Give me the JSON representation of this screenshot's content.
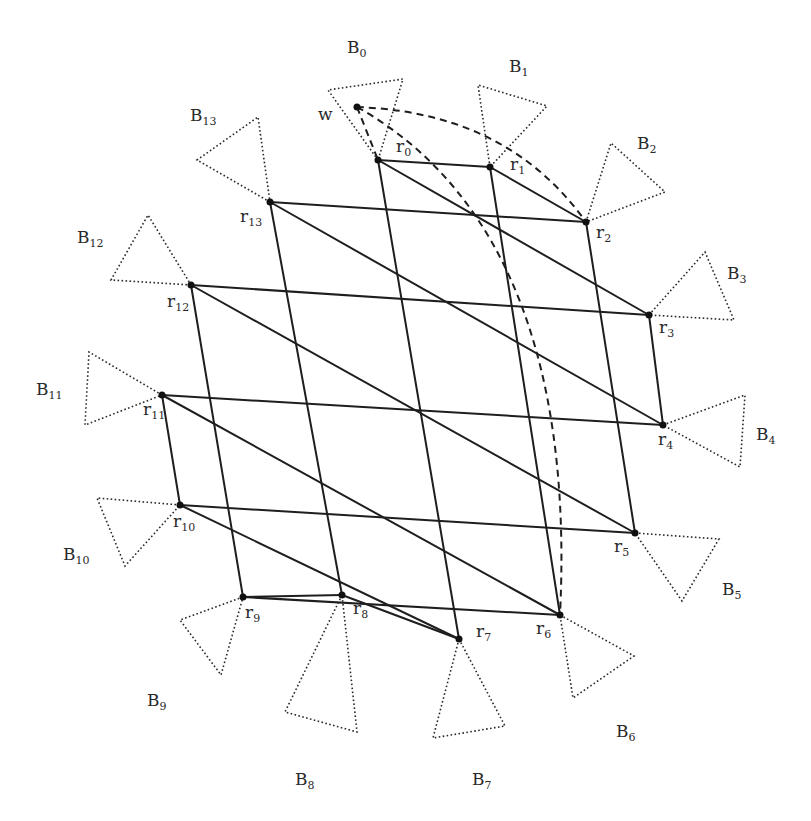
{
  "diagram": {
    "colors": {
      "ink": "#1e1e1e",
      "background": "#ffffff"
    },
    "w": {
      "label": "w",
      "x": 357,
      "y": 107,
      "label_x": 318,
      "label_y": 120
    },
    "nodes": [
      {
        "id": "r0",
        "base": "r",
        "sub": "0",
        "x": 378,
        "y": 160,
        "lx": 396,
        "ly": 152
      },
      {
        "id": "r1",
        "base": "r",
        "sub": "1",
        "x": 490,
        "y": 167,
        "lx": 510,
        "ly": 170
      },
      {
        "id": "r2",
        "base": "r",
        "sub": "2",
        "x": 586,
        "y": 222,
        "lx": 596,
        "ly": 238
      },
      {
        "id": "r3",
        "base": "r",
        "sub": "3",
        "x": 649,
        "y": 315,
        "lx": 659,
        "ly": 333
      },
      {
        "id": "r4",
        "base": "r",
        "sub": "4",
        "x": 663,
        "y": 425,
        "lx": 658,
        "ly": 445
      },
      {
        "id": "r5",
        "base": "r",
        "sub": "5",
        "x": 635,
        "y": 533,
        "lx": 614,
        "ly": 552
      },
      {
        "id": "r6",
        "base": "r",
        "sub": "6",
        "x": 560,
        "y": 615,
        "lx": 536,
        "ly": 634
      },
      {
        "id": "r7",
        "base": "r",
        "sub": "7",
        "x": 459,
        "y": 639,
        "lx": 476,
        "ly": 637
      },
      {
        "id": "r8",
        "base": "r",
        "sub": "8",
        "x": 342,
        "y": 595,
        "lx": 353,
        "ly": 614
      },
      {
        "id": "r9",
        "base": "r",
        "sub": "9",
        "x": 243,
        "y": 597,
        "lx": 245,
        "ly": 618
      },
      {
        "id": "r10",
        "base": "r",
        "sub": "10",
        "x": 180,
        "y": 505,
        "lx": 173,
        "ly": 527
      },
      {
        "id": "r11",
        "base": "r",
        "sub": "11",
        "x": 162,
        "y": 395,
        "lx": 143,
        "ly": 415
      },
      {
        "id": "r12",
        "base": "r",
        "sub": "12",
        "x": 191,
        "y": 285,
        "lx": 167,
        "ly": 307
      },
      {
        "id": "r13",
        "base": "r",
        "sub": "13",
        "x": 270,
        "y": 202,
        "lx": 240,
        "ly": 222
      }
    ],
    "sectors": [
      {
        "id": "B0",
        "base": "B",
        "sub": "0",
        "lx": 347,
        "ly": 53,
        "pts": "378,160 328,90 403,79"
      },
      {
        "id": "B1",
        "base": "B",
        "sub": "1",
        "lx": 509,
        "ly": 72,
        "pts": "490,167 478,85 547,106"
      },
      {
        "id": "B2",
        "base": "B",
        "sub": "2",
        "lx": 637,
        "ly": 149,
        "pts": "586,222 611,143 665,192"
      },
      {
        "id": "B3",
        "base": "B",
        "sub": "3",
        "lx": 727,
        "ly": 279,
        "pts": "649,315 705,252 734,320"
      },
      {
        "id": "B4",
        "base": "B",
        "sub": "4",
        "lx": 756,
        "ly": 440,
        "pts": "663,425 745,395 740,467"
      },
      {
        "id": "B5",
        "base": "B",
        "sub": "5",
        "lx": 722,
        "ly": 595,
        "pts": "635,533 719,539 682,601"
      },
      {
        "id": "B6",
        "base": "B",
        "sub": "6",
        "lx": 616,
        "ly": 737,
        "pts": "560,615 634,656 573,698"
      },
      {
        "id": "B7",
        "base": "B",
        "sub": "7",
        "lx": 472,
        "ly": 785,
        "pts": "459,639 505,726 433,738"
      },
      {
        "id": "B8",
        "base": "B",
        "sub": "8",
        "lx": 295,
        "ly": 785,
        "pts": "342,595 285,712 357,732"
      },
      {
        "id": "B9",
        "base": "B",
        "sub": "9",
        "lx": 147,
        "ly": 706,
        "pts": "243,597 180,620 221,675"
      },
      {
        "id": "B10",
        "base": "B",
        "sub": "10",
        "lx": 63,
        "ly": 560,
        "pts": "180,505 97,498 125,566"
      },
      {
        "id": "B11",
        "base": "B",
        "sub": "11",
        "lx": 36,
        "ly": 395,
        "pts": "162,395 89,352 85,425"
      },
      {
        "id": "B12",
        "base": "B",
        "sub": "12",
        "lx": 77,
        "ly": 243,
        "pts": "191,285 111,280 148,215"
      },
      {
        "id": "B13",
        "base": "B",
        "sub": "13",
        "lx": 190,
        "ly": 121,
        "pts": "270,202 197,160 258,117"
      }
    ],
    "edges": {
      "rows": [
        [
          "r0",
          "r1"
        ],
        [
          "r13",
          "r2"
        ],
        [
          "r12",
          "r3"
        ],
        [
          "r11",
          "r4"
        ],
        [
          "r10",
          "r5"
        ],
        [
          "r9",
          "r6"
        ],
        [
          "r8",
          "r7"
        ]
      ],
      "columns": [
        [
          "r0",
          "r7"
        ],
        [
          "r1",
          "r6"
        ],
        [
          "r2",
          "r5"
        ],
        [
          "r3",
          "r4"
        ],
        [
          "r13",
          "r8"
        ],
        [
          "r12",
          "r9"
        ],
        [
          "r11",
          "r10"
        ]
      ],
      "diagonals": [
        [
          "r1",
          "r2"
        ],
        [
          "r0",
          "r3"
        ],
        [
          "r13",
          "r4"
        ],
        [
          "r12",
          "r5"
        ],
        [
          "r11",
          "r6"
        ],
        [
          "r10",
          "r7"
        ],
        [
          "r9",
          "r8"
        ]
      ]
    },
    "dashed_paths": [
      {
        "id": "w-to-r0",
        "d": "M357,107 L378,160"
      },
      {
        "id": "w-to-r2",
        "d": "M357,107 C430,110 520,130 586,222"
      },
      {
        "id": "w-to-r6",
        "d": "M357,107 C470,170 575,310 560,615"
      }
    ]
  }
}
